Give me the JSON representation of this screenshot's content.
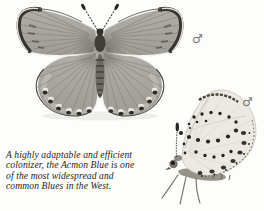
{
  "page": {
    "background": "#fdfdfb"
  },
  "caption": {
    "lines": [
      "A highly adaptable and efficient",
      "colonizer, the Acmon Blue is one",
      "of the most widespread and",
      "common Blues in the West."
    ],
    "color": "#262420"
  },
  "figures": {
    "dorsal": {
      "subject": "butterfly with wings spread, dorsal view",
      "sex_symbol": "♂"
    },
    "ventral": {
      "subject": "butterfly with wings folded, ventral view",
      "sex_symbol": "♂"
    }
  },
  "colors": {
    "dorsal_wing": "#a8a6a1",
    "margin_dark": "#37352d",
    "ventral_wing": "#ece9e3",
    "spot": "#26241f",
    "symbol": "#787670"
  }
}
